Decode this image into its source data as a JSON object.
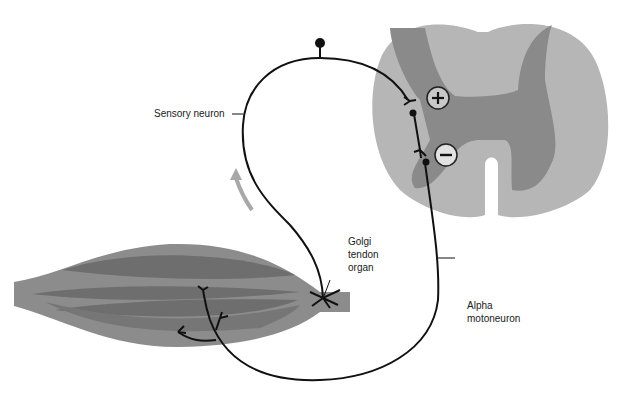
{
  "diagram": {
    "labels": {
      "sensory_neuron": "Sensory neuron",
      "golgi_line1": "Golgi",
      "golgi_line2": "tendon",
      "golgi_line3": "organ",
      "alpha_line1": "Alpha",
      "alpha_line2": "motoneuron"
    },
    "synapse_signs": {
      "excitatory": "+",
      "inhibitory": "−"
    },
    "colors": {
      "white_matter": "#b4b4b4",
      "gray_matter": "#8a8a8a",
      "muscle": "#8c8c8c",
      "muscle_fiber": "#7a7a7a",
      "neuron": "#111111",
      "arrow": "#a8a8a8"
    }
  }
}
